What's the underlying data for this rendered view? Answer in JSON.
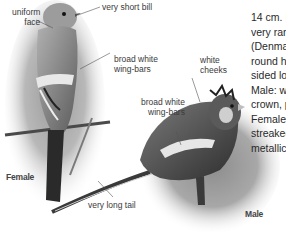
{
  "figure": {
    "birds": [
      {
        "sex_label": "Female"
      },
      {
        "sex_label": "Male"
      }
    ],
    "annotations": {
      "uniform_face": [
        "uniform",
        "face"
      ],
      "very_short_bill": "very short bill",
      "female_wing_bars": [
        "broad white",
        "wing-bars"
      ],
      "white_cheeks": [
        "white",
        "cheeks"
      ],
      "male_wing_bars": [
        "broad white",
        "wing-bars"
      ],
      "very_long_tail": "very long tail"
    },
    "description_lines": [
      "14 cm. I",
      "very rare",
      "(Denma",
      "round h",
      "sided lo",
      "Male: w",
      "crown, p",
      "Female:",
      "streaked",
      "metallic"
    ]
  }
}
